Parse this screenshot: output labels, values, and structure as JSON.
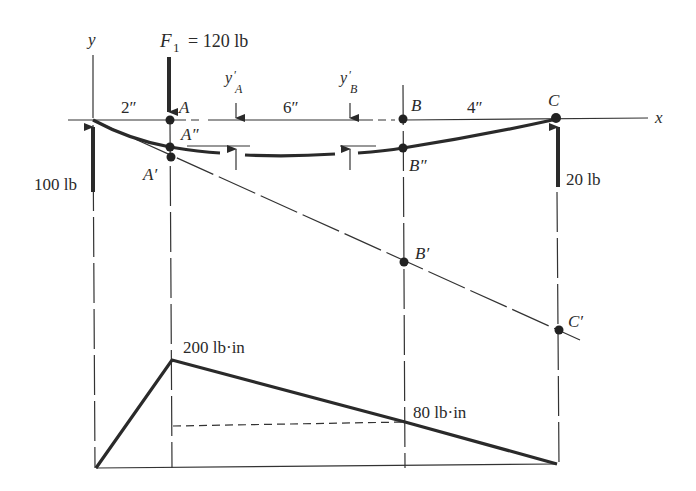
{
  "diagram": {
    "axes": {
      "y_label": "y",
      "x_label": "x"
    },
    "load": {
      "symbol": "F",
      "subscript": "1",
      "value": "= 120 lb"
    },
    "points": {
      "A": "A",
      "B": "B",
      "C": "C",
      "A_dbl": "A″",
      "B_dbl": "B″",
      "A_prime": "A′",
      "B_prime": "B′",
      "C_prime": "C′"
    },
    "dimensions": {
      "seg1": "2″",
      "seg2": "6″",
      "seg3": "4″"
    },
    "deflection_labels": {
      "yA": {
        "base": "y",
        "prime": "′",
        "sub": "A"
      },
      "yB": {
        "base": "y",
        "prime": "′",
        "sub": "B"
      }
    },
    "reactions": {
      "left": "100 lb",
      "right": "20 lb"
    },
    "moment_diagram": {
      "peak_label": "200 lb·in",
      "b_label": "80 lb·in"
    }
  }
}
